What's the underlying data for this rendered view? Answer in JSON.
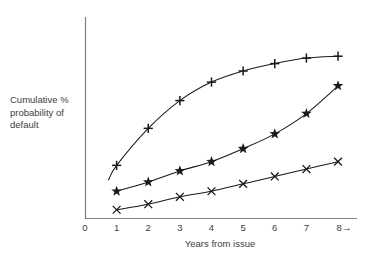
{
  "chart_data": {
    "type": "line",
    "title": "",
    "xlabel": "Years from issue",
    "ylabel": "Cumulative % probability of default",
    "ylabel_lines": [
      "Cumulative %",
      "probability of",
      "default"
    ],
    "x": [
      1,
      2,
      3,
      4,
      5,
      6,
      7,
      8
    ],
    "xlim": [
      0,
      8.6
    ],
    "ylim": [
      0,
      100
    ],
    "xticks": [
      "0",
      "1",
      "2",
      "3",
      "4",
      "5",
      "6",
      "7",
      "8"
    ],
    "x_axis_arrow": "→",
    "x_axis_end_label": "8→",
    "yticks": [],
    "grid": false,
    "legend": "none",
    "axis_color": "#808080",
    "line_color": "#1a1a1a",
    "series": [
      {
        "name": "high-risk",
        "marker": "plus",
        "values": [
          29,
          49,
          64,
          74,
          80,
          84,
          87,
          88
        ],
        "has_left_tail": true
      },
      {
        "name": "medium-risk",
        "marker": "star",
        "values": [
          15,
          20,
          26,
          31,
          38,
          46,
          57,
          72
        ]
      },
      {
        "name": "low-risk",
        "marker": "cross",
        "values": [
          5,
          8,
          12,
          15,
          19,
          23,
          27,
          31
        ]
      }
    ]
  },
  "axis": {
    "x_origin_label": "0",
    "tick_labels": [
      "0",
      "1",
      "2",
      "3",
      "4",
      "5",
      "6",
      "7",
      "8→"
    ]
  }
}
